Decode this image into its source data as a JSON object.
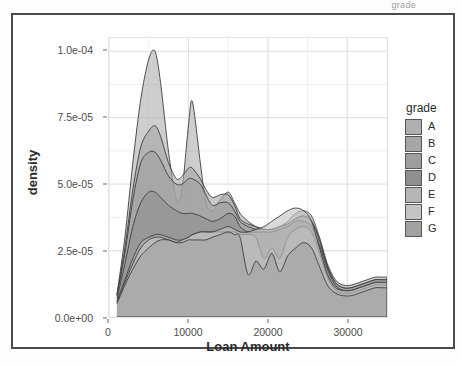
{
  "top_strip_text": "grade",
  "axis": {
    "x_title": "Loan Amount",
    "y_title": "density",
    "x_ticks": [
      "0",
      "10000",
      "20000",
      "30000"
    ],
    "y_ticks": [
      "0.0e+00",
      "2.5e-05",
      "5.0e-05",
      "7.5e-05",
      "1.0e-04"
    ]
  },
  "legend": {
    "title": "grade",
    "items": [
      {
        "label": "A",
        "color": "#b0b0b0"
      },
      {
        "label": "B",
        "color": "#a7a7a7"
      },
      {
        "label": "C",
        "color": "#9e9e9e"
      },
      {
        "label": "D",
        "color": "#8f8f8f"
      },
      {
        "label": "E",
        "color": "#b5b5b5"
      },
      {
        "label": "F",
        "color": "#c4c4c4"
      },
      {
        "label": "G",
        "color": "#a2a2a2"
      }
    ]
  },
  "chart_data": {
    "type": "area",
    "title": "",
    "subtitle": "",
    "xlabel": "Loan Amount",
    "ylabel": "density",
    "xlim": [
      0,
      35000
    ],
    "ylim": [
      0,
      0.000105
    ],
    "x_ticks": [
      0,
      10000,
      20000,
      30000
    ],
    "y_ticks": [
      0.0,
      2.5e-05,
      5e-05,
      7.5e-05,
      0.0001
    ],
    "grid": true,
    "legend_position": "right",
    "legend_title": "grade",
    "stacked": false,
    "note": "Overlapping kernel-density curves of loan amount by credit grade A-G; y values are density (per dollar).",
    "x": [
      1000,
      2000,
      3000,
      4000,
      5000,
      5800,
      6500,
      7500,
      8500,
      9200,
      10000,
      10500,
      11500,
      12200,
      13000,
      14000,
      15000,
      15800,
      16500,
      17500,
      18500,
      19500,
      20500,
      21500,
      22500,
      23500,
      24500,
      25500,
      26500,
      27500,
      28500,
      29500,
      30500,
      31500,
      32500,
      33500,
      34500,
      35000
    ],
    "series": [
      {
        "name": "A",
        "color": "#b0b0b0",
        "values": [
          8.5e-06,
          3e-05,
          5.8e-05,
          8.2e-05,
          9.7e-05,
          0.0001,
          8.8e-05,
          6.2e-05,
          4.4e-05,
          4.8e-05,
          7.2e-05,
          8.1e-05,
          5.8e-05,
          4.3e-05,
          4e-05,
          4.4e-05,
          4.7e-05,
          4.3e-05,
          3.9e-05,
          3.6e-05,
          3.4e-05,
          3.3e-05,
          3.3e-05,
          3.4e-05,
          3.6e-05,
          3.9e-05,
          4e-05,
          3.8e-05,
          3e-05,
          2e-05,
          1.4e-05,
          1.2e-05,
          1.2e-05,
          1.3e-05,
          1.4e-05,
          1.5e-05,
          1.5e-05,
          1.5e-05
        ]
      },
      {
        "name": "B",
        "color": "#a7a7a7",
        "values": [
          8.2e-06,
          2.6e-05,
          4.8e-05,
          6.4e-05,
          7e-05,
          7.2e-05,
          6.8e-05,
          5.8e-05,
          5.2e-05,
          5.3e-05,
          5.6e-05,
          5.6e-05,
          5.2e-05,
          4.8e-05,
          4.5e-05,
          4.6e-05,
          4.6e-05,
          4.2e-05,
          3.7e-05,
          3.5e-05,
          3.4e-05,
          3.3e-05,
          3.3e-05,
          3.4e-05,
          3.5e-05,
          3.7e-05,
          3.8e-05,
          3.6e-05,
          2.9e-05,
          1.9e-05,
          1.3e-05,
          1.1e-05,
          1.1e-05,
          1.2e-05,
          1.3e-05,
          1.4e-05,
          1.4e-05,
          1.4e-05
        ]
      },
      {
        "name": "C",
        "color": "#9e9e9e",
        "values": [
          8e-06,
          2.4e-05,
          4.4e-05,
          5.8e-05,
          6.2e-05,
          6.2e-05,
          5.9e-05,
          5.3e-05,
          5e-05,
          5e-05,
          5.2e-05,
          5.2e-05,
          5e-05,
          4.6e-05,
          4.2e-05,
          4.3e-05,
          4.3e-05,
          4e-05,
          3.6e-05,
          3.4e-05,
          3.3e-05,
          3.3e-05,
          3.3e-05,
          3.4e-05,
          3.5e-05,
          3.7e-05,
          3.8e-05,
          3.6e-05,
          2.9e-05,
          1.9e-05,
          1.3e-05,
          1.1e-05,
          1.1e-05,
          1.2e-05,
          1.3e-05,
          1.4e-05,
          1.4e-05,
          1.4e-05
        ]
      },
      {
        "name": "D",
        "color": "#8f8f8f",
        "values": [
          7e-06,
          2e-05,
          3.4e-05,
          4.3e-05,
          4.7e-05,
          4.7e-05,
          4.5e-05,
          4.2e-05,
          4e-05,
          3.9e-05,
          3.9e-05,
          3.9e-05,
          3.8e-05,
          3.7e-05,
          3.6e-05,
          3.7e-05,
          3.9e-05,
          3.8e-05,
          3.4e-05,
          3.2e-05,
          3.2e-05,
          3.2e-05,
          3.2e-05,
          3.3e-05,
          3.4e-05,
          3.6e-05,
          3.6e-05,
          3.4e-05,
          2.7e-05,
          1.8e-05,
          1.2e-05,
          1e-05,
          1e-05,
          1.1e-05,
          1.2e-05,
          1.3e-05,
          1.3e-05,
          1.3e-05
        ]
      },
      {
        "name": "E",
        "color": "#b5b5b5",
        "values": [
          6e-06,
          1.4e-05,
          2.2e-05,
          2.8e-05,
          3e-05,
          3.1e-05,
          3.1e-05,
          3e-05,
          2.9e-05,
          2.9e-05,
          3e-05,
          3.1e-05,
          3.2e-05,
          3.2e-05,
          3.2e-05,
          3.2e-05,
          3.2e-05,
          3.2e-05,
          3.1e-05,
          3.1e-05,
          3e-05,
          2.2e-05,
          2.6e-05,
          2.2e-05,
          3e-05,
          3.3e-05,
          3.4e-05,
          3.2e-05,
          2.4e-05,
          1.5e-05,
          1e-05,
          9e-06,
          9e-06,
          1e-05,
          1.1e-05,
          1.2e-05,
          1.2e-05,
          1.2e-05
        ]
      },
      {
        "name": "F",
        "color": "#c4c4c4",
        "values": [
          5.5e-06,
          1.3e-05,
          2e-05,
          2.6e-05,
          2.9e-05,
          3e-05,
          3e-05,
          2.9e-05,
          2.8e-05,
          2.9e-05,
          3e-05,
          3.1e-05,
          3.2e-05,
          3.2e-05,
          3.2e-05,
          3.3e-05,
          3.4e-05,
          3.3e-05,
          3.2e-05,
          3.2e-05,
          3.3e-05,
          3.4e-05,
          3.6e-05,
          3.8e-05,
          4e-05,
          4.1e-05,
          4e-05,
          3.6e-05,
          2.6e-05,
          1.6e-05,
          1.1e-05,
          1e-05,
          1e-05,
          1.1e-05,
          1.2e-05,
          1.3e-05,
          1.3e-05,
          1.3e-05
        ]
      },
      {
        "name": "G",
        "color": "#a2a2a2",
        "values": [
          5e-06,
          1.2e-05,
          1.8e-05,
          2.3e-05,
          2.6e-05,
          2.8e-05,
          2.9e-05,
          2.9e-05,
          2.8e-05,
          2.8e-05,
          2.9e-05,
          2.9e-05,
          2.9e-05,
          2.9e-05,
          3e-05,
          3.1e-05,
          3.2e-05,
          3.1e-05,
          3e-05,
          1.6e-05,
          2.1e-05,
          1.8e-05,
          2.4e-05,
          1.7e-05,
          2.3e-05,
          2.6e-05,
          2.8e-05,
          2.6e-05,
          1.9e-05,
          1.2e-05,
          9e-06,
          8e-06,
          8e-06,
          9e-06,
          1e-05,
          1.1e-05,
          1.1e-05,
          1.1e-05
        ]
      }
    ]
  }
}
